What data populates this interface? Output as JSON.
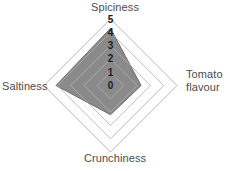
{
  "chart_data": {
    "type": "radar",
    "title": "",
    "categories": [
      "Spiciness",
      "Tomato flavour",
      "Crunchiness",
      "Saltiness"
    ],
    "values": [
      4.3,
      2.3,
      2.2,
      4.1
    ],
    "series": [
      {
        "name": "",
        "values": [
          4.3,
          2.3,
          2.2,
          4.1
        ],
        "fill_color": "#8a8a8a",
        "line_color": "#6e6e6e"
      }
    ],
    "axis_labels": {
      "top": "Spiciness",
      "right": "Tomato flavour",
      "right_line1": "Tomato",
      "right_line2": "flavour",
      "bottom": "Crunchiness",
      "left": "Saltiness"
    },
    "tick_labels": [
      "0",
      "1",
      "2",
      "3",
      "4",
      "5"
    ],
    "tick_values": [
      0,
      1,
      2,
      3,
      4,
      5
    ],
    "rlim": [
      0,
      5
    ],
    "rings": [
      1,
      2,
      3,
      4,
      5
    ],
    "grid": true,
    "grid_color": "#b4b4b4",
    "legend": "none",
    "background_color": "#ffffff",
    "tick_axis": "Spiciness"
  }
}
